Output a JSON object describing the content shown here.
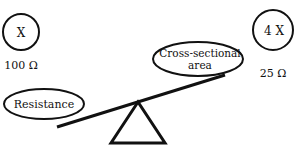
{
  "diagram": {
    "left_circle": {
      "label": "X",
      "value": "100 Ω"
    },
    "right_circle": {
      "label": "4 X",
      "value": "25 Ω"
    },
    "left_ellipse": {
      "label": "Resistance"
    },
    "right_ellipse": {
      "line1": "Cross-sectional",
      "line2": "area"
    },
    "colors": {
      "stroke": "#111111",
      "background": "#ffffff"
    }
  }
}
